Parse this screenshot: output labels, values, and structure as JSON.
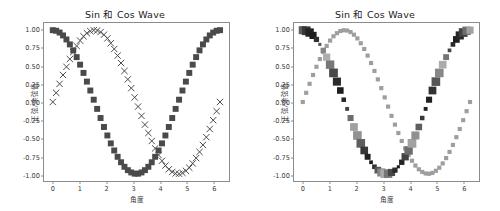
{
  "chart_data": [
    {
      "id": "figure-1",
      "type": "scatter",
      "title": "Sin 和 Cos Wave",
      "xlabel": "角度",
      "ylabel": "正弦/余弦值",
      "xlim": [
        -0.33,
        6.62
      ],
      "ylim": [
        -1.1,
        1.1
      ],
      "xticks": [
        0,
        1,
        2,
        3,
        4,
        5,
        6
      ],
      "xticklabels": [
        "0",
        "1",
        "2",
        "3",
        "4",
        "5",
        "6"
      ],
      "yticks": [
        1.0,
        0.75,
        0.5,
        0.25,
        0.0,
        -0.25,
        -0.5,
        -0.75,
        -1.0
      ],
      "yticklabels": [
        "1.00",
        "0.75",
        "0.50",
        "0.25",
        "0.00",
        "-0.25",
        "-0.50",
        "-0.75",
        "-1.00"
      ],
      "grid": false,
      "legend": "none",
      "series": [
        {
          "name": "sin",
          "marker": "x",
          "color": "#4a4a4a",
          "size": 3.2,
          "x": [
            0.0,
            0.128,
            0.256,
            0.385,
            0.513,
            0.641,
            0.769,
            0.897,
            1.026,
            1.154,
            1.282,
            1.41,
            1.538,
            1.667,
            1.795,
            1.923,
            2.051,
            2.179,
            2.308,
            2.436,
            2.564,
            2.692,
            2.82,
            2.949,
            3.077,
            3.205,
            3.333,
            3.462,
            3.59,
            3.718,
            3.846,
            3.974,
            4.103,
            4.231,
            4.359,
            4.487,
            4.615,
            4.744,
            4.872,
            5.0,
            5.128,
            5.256,
            5.385,
            5.513,
            5.641,
            5.769,
            5.897,
            6.026,
            6.154,
            6.283
          ],
          "y": [
            0.0,
            0.128,
            0.253,
            0.376,
            0.49,
            0.598,
            0.695,
            0.781,
            0.855,
            0.915,
            0.958,
            0.987,
            0.999,
            0.995,
            0.974,
            0.937,
            0.885,
            0.818,
            0.738,
            0.646,
            0.543,
            0.432,
            0.315,
            0.193,
            0.064,
            -0.064,
            -0.193,
            -0.315,
            -0.432,
            -0.543,
            -0.646,
            -0.738,
            -0.818,
            -0.885,
            -0.937,
            -0.974,
            -0.995,
            -0.999,
            -0.987,
            -0.958,
            -0.915,
            -0.855,
            -0.781,
            -0.695,
            -0.598,
            -0.49,
            -0.376,
            -0.253,
            -0.128,
            0.0
          ]
        },
        {
          "name": "cos",
          "marker": "s",
          "color": "#4a4a4a",
          "size": 3.0,
          "x": [
            0.0,
            0.128,
            0.256,
            0.385,
            0.513,
            0.641,
            0.769,
            0.897,
            1.026,
            1.154,
            1.282,
            1.41,
            1.538,
            1.667,
            1.795,
            1.923,
            2.051,
            2.179,
            2.308,
            2.436,
            2.564,
            2.692,
            2.82,
            2.949,
            3.077,
            3.205,
            3.333,
            3.462,
            3.59,
            3.718,
            3.846,
            3.974,
            4.103,
            4.231,
            4.359,
            4.487,
            4.615,
            4.744,
            4.872,
            5.0,
            5.128,
            5.256,
            5.385,
            5.513,
            5.641,
            5.769,
            5.897,
            6.026,
            6.154,
            6.283
          ],
          "y": [
            1.0,
            0.992,
            0.967,
            0.927,
            0.871,
            0.802,
            0.719,
            0.625,
            0.52,
            0.405,
            0.284,
            0.16,
            0.032,
            -0.096,
            -0.223,
            -0.348,
            -0.466,
            -0.576,
            -0.675,
            -0.763,
            -0.839,
            -0.902,
            -0.949,
            -0.981,
            -0.998,
            -0.998,
            -0.981,
            -0.949,
            -0.902,
            -0.839,
            -0.763,
            -0.675,
            -0.576,
            -0.466,
            -0.348,
            -0.223,
            -0.096,
            0.032,
            0.16,
            0.284,
            0.405,
            0.52,
            0.625,
            0.719,
            0.802,
            0.871,
            0.927,
            0.967,
            0.992,
            1.0
          ]
        }
      ]
    },
    {
      "id": "figure-2",
      "type": "scatter",
      "title": "Sin 和 Cos Wave",
      "xlabel": "角度",
      "ylabel": "正弦/余弦值",
      "xlim": [
        -0.33,
        6.62
      ],
      "ylim": [
        -1.1,
        1.1
      ],
      "xticks": [
        0,
        1,
        2,
        3,
        4,
        5,
        6
      ],
      "xticklabels": [
        "0",
        "1",
        "2",
        "3",
        "4",
        "5",
        "6"
      ],
      "yticks": [
        1.0,
        0.75,
        0.5,
        0.25,
        0.0,
        -0.25,
        -0.5,
        -0.75,
        -1.0
      ],
      "yticklabels": [
        "1.00",
        "0.75",
        "0.50",
        "0.25",
        "0.00",
        "-0.25",
        "-0.50",
        "-0.75",
        "-1.00"
      ],
      "grid": false,
      "legend": "none",
      "series": [
        {
          "name": "sin",
          "marker": "s",
          "color": "#9e9e9e",
          "size": 2.1,
          "x": [
            0.0,
            0.128,
            0.256,
            0.385,
            0.513,
            0.641,
            0.769,
            0.897,
            1.026,
            1.154,
            1.282,
            1.41,
            1.538,
            1.667,
            1.795,
            1.923,
            2.051,
            2.179,
            2.308,
            2.436,
            2.564,
            2.692,
            2.82,
            2.949,
            3.077,
            3.205,
            3.333,
            3.462,
            3.59,
            3.718,
            3.846,
            3.974,
            4.103,
            4.231,
            4.359,
            4.487,
            4.615,
            4.744,
            4.872,
            5.0,
            5.128,
            5.256,
            5.385,
            5.513,
            5.641,
            5.769,
            5.897,
            6.026,
            6.154,
            6.283
          ],
          "y": [
            0.0,
            0.128,
            0.253,
            0.376,
            0.49,
            0.598,
            0.695,
            0.781,
            0.855,
            0.915,
            0.958,
            0.987,
            0.999,
            0.995,
            0.974,
            0.937,
            0.885,
            0.818,
            0.738,
            0.646,
            0.543,
            0.432,
            0.315,
            0.193,
            0.064,
            -0.064,
            -0.193,
            -0.315,
            -0.432,
            -0.543,
            -0.646,
            -0.738,
            -0.818,
            -0.885,
            -0.937,
            -0.974,
            -0.995,
            -0.999,
            -0.987,
            -0.958,
            -0.915,
            -0.855,
            -0.781,
            -0.695,
            -0.598,
            -0.49,
            -0.376,
            -0.253,
            -0.128,
            0.0
          ]
        },
        {
          "name": "cos",
          "marker": "s",
          "color": "#707070",
          "size": 3.4,
          "varying_size": true,
          "varying_color": true,
          "x": [
            0.0,
            0.128,
            0.256,
            0.385,
            0.513,
            0.641,
            0.769,
            0.897,
            1.026,
            1.154,
            1.282,
            1.41,
            1.538,
            1.667,
            1.795,
            1.923,
            2.051,
            2.179,
            2.308,
            2.436,
            2.564,
            2.692,
            2.82,
            2.949,
            3.077,
            3.205,
            3.333,
            3.462,
            3.59,
            3.718,
            3.846,
            3.974,
            4.103,
            4.231,
            4.359,
            4.487,
            4.615,
            4.744,
            4.872,
            5.0,
            5.128,
            5.256,
            5.385,
            5.513,
            5.641,
            5.769,
            5.897,
            6.026,
            6.154,
            6.283
          ],
          "y": [
            1.0,
            0.992,
            0.967,
            0.927,
            0.871,
            0.802,
            0.719,
            0.625,
            0.52,
            0.405,
            0.284,
            0.16,
            0.032,
            -0.096,
            -0.223,
            -0.348,
            -0.466,
            -0.576,
            -0.675,
            -0.763,
            -0.839,
            -0.902,
            -0.949,
            -0.981,
            -0.998,
            -0.998,
            -0.981,
            -0.949,
            -0.902,
            -0.839,
            -0.763,
            -0.675,
            -0.576,
            -0.466,
            -0.348,
            -0.223,
            -0.096,
            0.032,
            0.16,
            0.284,
            0.405,
            0.52,
            0.625,
            0.719,
            0.802,
            0.871,
            0.927,
            0.967,
            0.992,
            1.0
          ]
        }
      ]
    }
  ],
  "colors": {
    "marker_dark": "#4a4a4a",
    "marker_light": "#b5b5b5",
    "axis": "#8c8c8c",
    "text": "#3a3a3a",
    "title": "#1a1a1a",
    "background": "#ffffff",
    "topbar": "#9a9a9a"
  }
}
